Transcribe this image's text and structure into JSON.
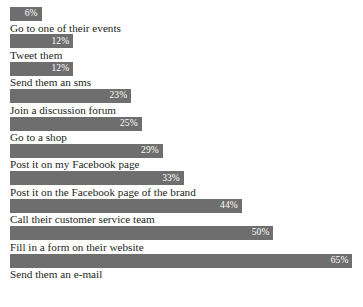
{
  "chart_data": {
    "type": "bar",
    "orientation": "horizontal",
    "title": "",
    "subtitle": "",
    "xlabel": "",
    "ylabel": "",
    "grid": false,
    "legend": false,
    "legend_position": "none",
    "value_suffix": "%",
    "xlim": [
      0,
      67
    ],
    "axis_visible": false,
    "tick_labels": [],
    "bar_color": "#6e6e6e",
    "value_label_color": "#ffffff",
    "category_label_color": "#231f20",
    "background_color": "#ffffff",
    "categories": [
      "Go to one of their events",
      "Tweet them",
      "Send them an sms",
      "Join a discussion forum",
      "Go to a shop",
      "Post it on my Facebook page",
      "Post it on the Facebook page of the brand",
      "Call their customer service team",
      "Fill in a form on their website",
      "Send them an e-mail"
    ],
    "values": [
      6,
      12,
      12,
      23,
      25,
      29,
      33,
      44,
      50,
      65
    ],
    "value_labels": [
      "6%",
      "12%",
      "12%",
      "23%",
      "25%",
      "29%",
      "33%",
      "44%",
      "50%",
      "65%"
    ],
    "bars": [
      {
        "label": "Go to one of their events",
        "value": 6,
        "value_label": "6%"
      },
      {
        "label": "Tweet them",
        "value": 12,
        "value_label": "12%"
      },
      {
        "label": "Send them an sms",
        "value": 12,
        "value_label": "12%"
      },
      {
        "label": "Join a discussion forum",
        "value": 23,
        "value_label": "23%"
      },
      {
        "label": "Go to a shop",
        "value": 25,
        "value_label": "25%"
      },
      {
        "label": "Post it on my Facebook page",
        "value": 29,
        "value_label": "29%"
      },
      {
        "label": "Post it on the Facebook page of the brand",
        "value": 33,
        "value_label": "33%"
      },
      {
        "label": "Call their customer service team",
        "value": 44,
        "value_label": "44%"
      },
      {
        "label": "Fill in a form on their website",
        "value": 50,
        "value_label": "50%"
      },
      {
        "label": "Send them an e-mail",
        "value": 65,
        "value_label": "65%"
      }
    ]
  }
}
